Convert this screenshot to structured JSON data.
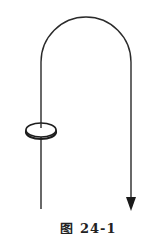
{
  "figure": {
    "caption": "图 24-1",
    "colors": {
      "stroke": "#2a2a2a",
      "background": "#ffffff"
    },
    "elements": {
      "path": "inverted U-shaped line (J-hook) with arrow pointing down on right end",
      "ring": "ellipse ring threaded on left vertical segment",
      "arrow_direction": "down"
    }
  }
}
